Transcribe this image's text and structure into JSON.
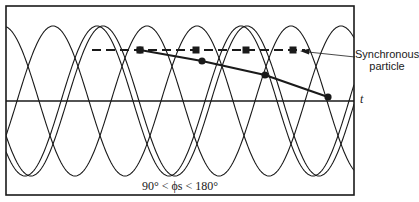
{
  "figure": {
    "annotation_label_line1": "Synchronous",
    "annotation_label_line2": "particle",
    "axis_label": "t",
    "phase_range_label": "90° < ϕs < 180°"
  },
  "colors": {
    "ink": "#1a1a1a",
    "background": "#ffffff"
  },
  "geometry": {
    "frame": {
      "x": 6,
      "y": 6,
      "w": 348,
      "h": 189
    },
    "axis_y": 101,
    "wave": {
      "amplitude": 75,
      "period": 144,
      "peaks_x": [
        97,
        147,
        197,
        247
      ]
    },
    "dashed_line": {
      "x1": 92,
      "x2": 305,
      "y": 50
    },
    "dashed_markers_x": [
      140,
      196,
      246,
      293
    ],
    "solid_markers": [
      [
        140,
        50
      ],
      [
        202,
        61
      ],
      [
        265,
        75
      ],
      [
        328,
        97
      ]
    ],
    "arrow": {
      "from": [
        355,
        57
      ],
      "to": [
        300,
        51
      ]
    }
  }
}
